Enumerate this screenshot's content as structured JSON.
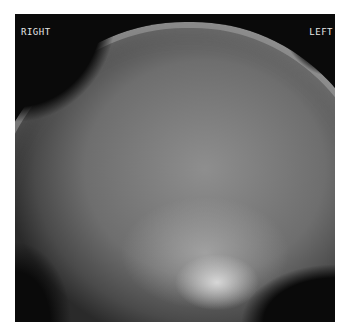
{
  "image": {
    "description": "Lateral skull X-ray radiograph",
    "orientation_labels": {
      "top_left": "RIGHT",
      "top_right": "LEFT"
    }
  },
  "colors": {
    "background": "#ffffff",
    "frame": "#0a0a0a",
    "label_text": "#e6e6e6"
  }
}
